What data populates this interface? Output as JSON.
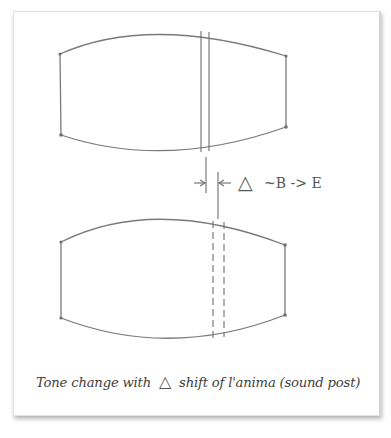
{
  "diagram": {
    "annotation": {
      "delta_symbol": "△",
      "relation": "~B -> E"
    },
    "caption": {
      "part1": "Tone change with",
      "delta_symbol": "△",
      "part2": "shift of l'anima (sound post)"
    },
    "shapes": [
      {
        "name": "upper-lens",
        "post_lines": "solid",
        "post_positions_x": [
          201,
          209
        ]
      },
      {
        "name": "lower-lens",
        "post_lines": "dashed",
        "post_positions_x": [
          213,
          224
        ]
      }
    ],
    "colors": {
      "line": "#7a7a7a",
      "text": "#3e3e3e",
      "background": "#ffffff"
    }
  }
}
